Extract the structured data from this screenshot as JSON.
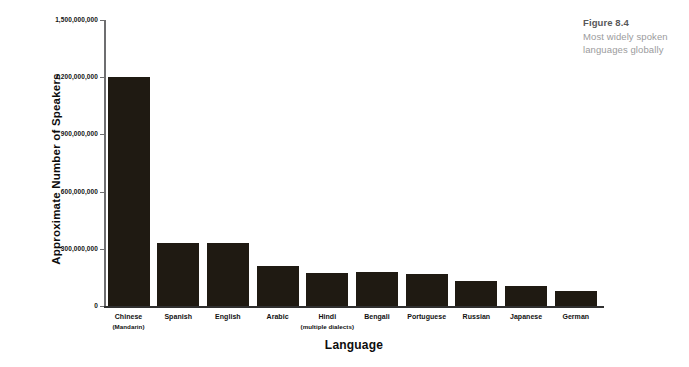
{
  "figure": {
    "number": "Figure 8.4",
    "caption_line_1": "Most widely spoken",
    "caption_line_2": "languages globally",
    "number_color": "#58585a",
    "caption_color": "#9b9b9d"
  },
  "axes": {
    "y_title": "Approximate Number of Speakers",
    "x_title": "Language"
  },
  "chart_data": {
    "type": "bar",
    "title": "Most widely spoken languages globally",
    "xlabel": "Language",
    "ylabel": "Approximate Number of Speakers",
    "ylim": [
      0,
      1500000000
    ],
    "grid": false,
    "legend": "none",
    "bar_color": "#1f1a12",
    "axis_color": "#6e6e70",
    "ytick_labels": [
      "1,500,000,000",
      "1,200,000,000",
      "900,000,000",
      "600,000,000",
      "300,000,000",
      "0"
    ],
    "ytick_values": [
      1500000000,
      1200000000,
      900000000,
      600000000,
      300000000,
      0
    ],
    "categories": [
      "Chinese (Mandarin)",
      "Spanish",
      "English",
      "Arabic",
      "Hindi (multiple dialects)",
      "Bengali",
      "Portuguese",
      "Russian",
      "Japanese",
      "German"
    ],
    "category_labels": [
      {
        "main": "Chinese",
        "sub": "(Mandarin)"
      },
      {
        "main": "Spanish",
        "sub": ""
      },
      {
        "main": "English",
        "sub": ""
      },
      {
        "main": "Arabic",
        "sub": ""
      },
      {
        "main": "Hindi",
        "sub": "(multiple dialects)"
      },
      {
        "main": "Bengali",
        "sub": ""
      },
      {
        "main": "Portuguese",
        "sub": ""
      },
      {
        "main": "Russian",
        "sub": ""
      },
      {
        "main": "Japanese",
        "sub": ""
      },
      {
        "main": "German",
        "sub": ""
      }
    ],
    "values": [
      1200000000,
      330000000,
      330000000,
      212000000,
      175000000,
      180000000,
      170000000,
      132000000,
      105000000,
      80000000
    ]
  }
}
